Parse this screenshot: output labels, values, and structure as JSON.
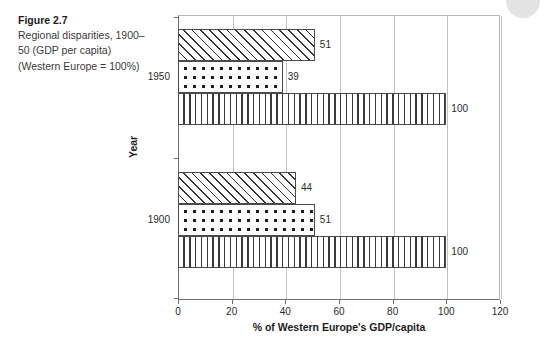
{
  "caption": {
    "title": "Figure 2.7",
    "body": "Regional disparities, 1900–50 (GDP per capita) (Western Europe = 100%)"
  },
  "decoration": {
    "corner_circle_color": "#d9d9d9"
  },
  "chart_data": {
    "type": "bar",
    "orientation": "horizontal",
    "title": "",
    "xlabel": "% of Western Europe's GDP/capita",
    "ylabel": "Year",
    "categories": [
      "1950",
      "1900"
    ],
    "xlim": [
      0,
      120
    ],
    "xticks": [
      0,
      20,
      40,
      60,
      80,
      100,
      120
    ],
    "xtick_labels": [
      "0",
      "20",
      "40",
      "60",
      "80",
      "100",
      "120"
    ],
    "grid": true,
    "grid_axis": "x",
    "legend": "none",
    "series": [
      {
        "name": "diagonal-hatch",
        "pattern": "diagonal",
        "values": [
          51,
          44
        ]
      },
      {
        "name": "dotted",
        "pattern": "dots",
        "values": [
          39,
          51
        ]
      },
      {
        "name": "vertical-hatch",
        "pattern": "vertical",
        "values": [
          100,
          100
        ]
      }
    ],
    "groups": [
      {
        "category": "1950",
        "bars": [
          {
            "pattern": "diagonal",
            "value": 51,
            "label": "51"
          },
          {
            "pattern": "dots",
            "value": 39,
            "label": "39"
          },
          {
            "pattern": "vertical",
            "value": 100,
            "label": "100"
          }
        ]
      },
      {
        "category": "1900",
        "bars": [
          {
            "pattern": "diagonal",
            "value": 44,
            "label": "44"
          },
          {
            "pattern": "dots",
            "value": 51,
            "label": "51"
          },
          {
            "pattern": "vertical",
            "value": 100,
            "label": "100"
          }
        ]
      }
    ]
  }
}
